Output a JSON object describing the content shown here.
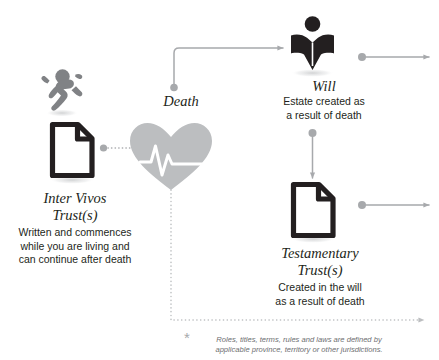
{
  "diagram": {
    "title_alt": "Trusts and death flow diagram",
    "nodes": [
      {
        "id": "inter-vivos",
        "icon": "document-icon",
        "secondary_icon": "running-person-icon",
        "title": "Inter Vivos\nTrust(s)",
        "description": "Written and commences\nwhile you are living and\ncan continue after death"
      },
      {
        "id": "death",
        "icon": "heart-heartbeat-icon",
        "title": "Death",
        "description": ""
      },
      {
        "id": "will",
        "icon": "person-open-book-icon",
        "title": "Will",
        "description": "Estate created as\na result of death"
      },
      {
        "id": "testamentary",
        "icon": "document-icon",
        "title": "Testamentary\nTrust(s)",
        "description": "Created in the will\nas a result of death"
      }
    ],
    "footnote": {
      "marker": "*",
      "text": "Roles, titles, terms, rules and laws are defined by\napplicable province, territory or other jurisdictions."
    },
    "colors": {
      "icon_dark": "#231f20",
      "icon_gray": "#808285",
      "connector_gray": "#a7a9ac",
      "heart_gray": "#bcbec0",
      "text_dark": "#231f20",
      "text_muted": "#6d6e71",
      "background": "#ffffff"
    }
  }
}
